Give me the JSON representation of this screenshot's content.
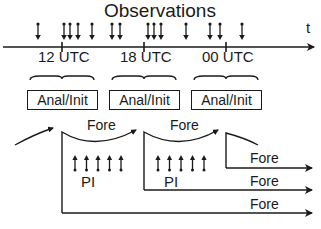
{
  "diagram": {
    "title": "Observations",
    "time_axis_label": "t",
    "time_ticks": [
      {
        "label": "12 UTC",
        "x": 62
      },
      {
        "label": "18 UTC",
        "x": 144
      },
      {
        "label": "00 UTC",
        "x": 226
      }
    ],
    "observation_arrow_x": [
      38,
      64,
      70,
      78,
      92,
      112,
      120,
      148,
      154,
      161,
      186,
      210,
      220,
      242
    ],
    "analysis_boxes": [
      {
        "label": "Anal/Init"
      },
      {
        "label": "Anal/Init"
      },
      {
        "label": "Anal/Init"
      }
    ],
    "forecast_labels": [
      "Fore",
      "Fore",
      "Fore",
      "Fore",
      "Fore"
    ],
    "pi_labels": [
      "PI",
      "PI"
    ],
    "pi_arrow_count": 5,
    "colors": {
      "line": "#1a1a1a",
      "background": "#ffffff"
    }
  }
}
